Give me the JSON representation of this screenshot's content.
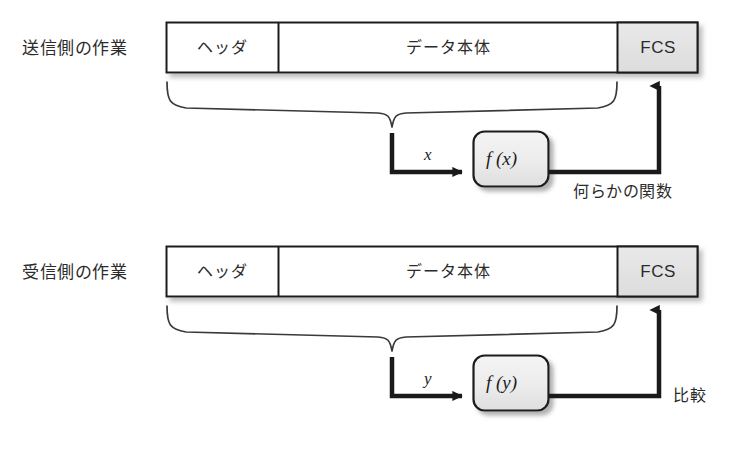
{
  "diagram": {
    "rows": [
      {
        "side_label": "送信側の作業",
        "frame": {
          "header_label": "ヘッダ",
          "body_label": "データ本体",
          "fcs_label": "FCS"
        },
        "variable_label": "x",
        "function_label": "f (x)",
        "note_label": "何らかの関数"
      },
      {
        "side_label": "受信側の作業",
        "frame": {
          "header_label": "ヘッダ",
          "body_label": "データ本体",
          "fcs_label": "FCS"
        },
        "variable_label": "y",
        "function_label": "f (y)",
        "note_label": "比較"
      }
    ],
    "colors": {
      "background": "#ffffff",
      "stroke": "#1a1a1a",
      "cell_fill": "#ffffff",
      "fcs_fill": "#e2e2e2",
      "function_box_fill": "#ececec",
      "shadow": "#b9b9b9",
      "text": "#2b2b2b"
    }
  }
}
